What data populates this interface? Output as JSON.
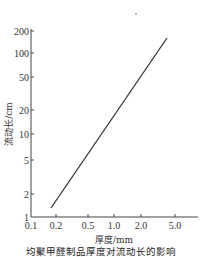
{
  "chart_data": {
    "type": "line",
    "title": "均聚甲醛制品厚度对流动长的影响",
    "xlabel": "厚度/mm",
    "ylabel": "流动长/cm",
    "xscale": "log",
    "yscale": "log",
    "xlim": [
      0.1,
      9
    ],
    "ylim": [
      1,
      200
    ],
    "x_ticks": [
      0.1,
      0.2,
      0.5,
      1.0,
      2.0,
      5.0
    ],
    "x_tick_labels": [
      "0.1",
      "0.2",
      "0.5",
      "1.0",
      "2.0",
      "5.0"
    ],
    "y_ticks": [
      1,
      2,
      5,
      10,
      20,
      50,
      100,
      200
    ],
    "y_tick_labels": [
      "1",
      "2",
      "5",
      "10",
      "20",
      "50",
      "100",
      "200"
    ],
    "grid": false,
    "legend": null,
    "series": [
      {
        "name": "均聚甲醛",
        "x": [
          0.18,
          4.2
        ],
        "y": [
          1.4,
          160
        ],
        "color": "#333333"
      }
    ]
  },
  "layout": {
    "plot_left": 31,
    "plot_right": 198,
    "plot_top": 31,
    "plot_bottom": 217,
    "x_tick_px": [
      31,
      56,
      88,
      114,
      141,
      175
    ],
    "y_tick_px": [
      217,
      194,
      160,
      134,
      110,
      77,
      53,
      31
    ],
    "line_px": [
      [
        51,
        208
      ],
      [
        167,
        38
      ]
    ],
    "dot_px": [
      136,
      14
    ]
  }
}
